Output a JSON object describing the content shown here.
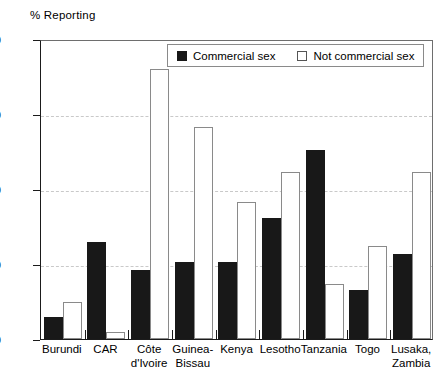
{
  "chart_data": {
    "type": "bar",
    "title": "% Reporting",
    "xlabel": "",
    "ylabel": "% Reporting",
    "ylim": [
      0,
      40
    ],
    "yticks": [
      0,
      10,
      20,
      30,
      40
    ],
    "grid": true,
    "legend_position": "top-center",
    "categories": [
      "Burundi",
      "CAR",
      "Côte d'Ivoire",
      "Guinea-Bissau",
      "Kenya",
      "Lesotho",
      "Tanzania",
      "Togo",
      "Lusaka, Zambia"
    ],
    "category_lines": [
      [
        "Burundi",
        ""
      ],
      [
        "CAR",
        ""
      ],
      [
        "Côte",
        "d'Ivoire"
      ],
      [
        "Guinea-",
        "Bissau"
      ],
      [
        "Kenya",
        ""
      ],
      [
        "Lesotho",
        ""
      ],
      [
        "Tanzania",
        ""
      ],
      [
        "Togo",
        ""
      ],
      [
        "Lusaka,",
        "Zambia"
      ]
    ],
    "series": [
      {
        "name": "Commercial sex",
        "color": "#181818",
        "values": [
          3.0,
          13.0,
          9.2,
          10.3,
          10.3,
          16.2,
          25.2,
          6.5,
          11.4
        ]
      },
      {
        "name": "Not commercial sex",
        "color": "#ffffff",
        "values": [
          5.0,
          1.0,
          36.0,
          28.3,
          18.3,
          22.3,
          7.3,
          12.4,
          22.3
        ]
      }
    ]
  },
  "legend": {
    "items": [
      {
        "label": "Commercial sex",
        "style": "filled"
      },
      {
        "label": "Not commercial sex",
        "style": "open"
      }
    ]
  }
}
